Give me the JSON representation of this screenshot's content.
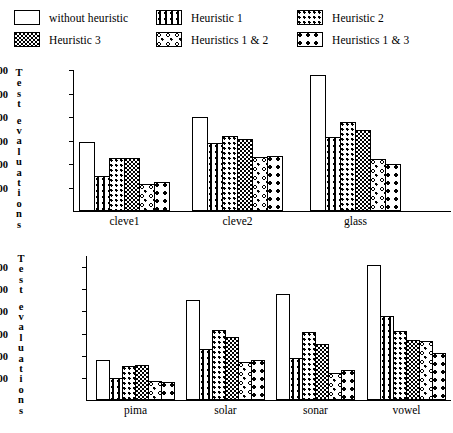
{
  "legend": {
    "items": [
      {
        "label": "without heuristic",
        "pattern": "plain",
        "col": 0,
        "row": 0
      },
      {
        "label": "Heuristic 1",
        "pattern": "h1",
        "col": 1,
        "row": 0
      },
      {
        "label": "Heuristic 2",
        "pattern": "h2",
        "col": 2,
        "row": 0
      },
      {
        "label": "Heuristic 3",
        "pattern": "h3",
        "col": 0,
        "row": 1
      },
      {
        "label": "Heuristics 1 & 2",
        "pattern": "h12",
        "col": 1,
        "row": 1
      },
      {
        "label": "Heuristics 1 & 3",
        "pattern": "h13",
        "col": 2,
        "row": 1
      }
    ]
  },
  "chart_data": [
    {
      "id": "top",
      "type": "bar",
      "title": "",
      "xlabel": "",
      "ylabel": "Test evaluations",
      "ylim": [
        0,
        6000
      ],
      "yticks": [
        1000,
        2000,
        3000,
        4000,
        5000,
        6000
      ],
      "ytick_labels": [
        "1000",
        "2000",
        "3000",
        "4000",
        "5000",
        "6000"
      ],
      "grid": false,
      "legend_position": "top",
      "categories": [
        "cleve1",
        "cleve2",
        "glass"
      ],
      "series": [
        {
          "name": "without heuristic",
          "pattern": "plain",
          "values": [
            2950,
            4000,
            5800
          ]
        },
        {
          "name": "Heuristic 1",
          "pattern": "h1",
          "values": [
            1500,
            2900,
            3150
          ]
        },
        {
          "name": "Heuristic 2",
          "pattern": "h2",
          "values": [
            2250,
            3200,
            3800
          ]
        },
        {
          "name": "Heuristic 3",
          "pattern": "h3",
          "values": [
            2250,
            3050,
            3450
          ]
        },
        {
          "name": "Heuristics 1 & 2",
          "pattern": "h12",
          "values": [
            1150,
            2300,
            2200
          ]
        },
        {
          "name": "Heuristics 1 & 3",
          "pattern": "h13",
          "values": [
            1250,
            2350,
            2000
          ]
        }
      ]
    },
    {
      "id": "bottom",
      "type": "bar",
      "title": "",
      "xlabel": "",
      "ylabel": "Test evaluations",
      "ylim": [
        0,
        65000
      ],
      "yticks": [
        10000,
        20000,
        30000,
        40000,
        50000,
        60000
      ],
      "ytick_labels": [
        "10000",
        "20000",
        "30000",
        "40000",
        "50000",
        "60000"
      ],
      "grid": false,
      "legend_position": "top",
      "categories": [
        "pima",
        "solar",
        "sonar",
        "vowel"
      ],
      "series": [
        {
          "name": "without heuristic",
          "pattern": "plain",
          "values": [
            18000,
            45000,
            48000,
            61000
          ]
        },
        {
          "name": "Heuristic 1",
          "pattern": "h1",
          "values": [
            10000,
            23000,
            19000,
            38000
          ]
        },
        {
          "name": "Heuristic 2",
          "pattern": "h2",
          "values": [
            15500,
            31500,
            30500,
            31000
          ]
        },
        {
          "name": "Heuristic 3",
          "pattern": "h3",
          "values": [
            16000,
            28500,
            25500,
            27000
          ]
        },
        {
          "name": "Heuristics 1 & 2",
          "pattern": "h12",
          "values": [
            8500,
            17000,
            12000,
            26500
          ]
        },
        {
          "name": "Heuristics 1 & 3",
          "pattern": "h13",
          "values": [
            8000,
            18000,
            13500,
            21000
          ]
        }
      ]
    }
  ]
}
